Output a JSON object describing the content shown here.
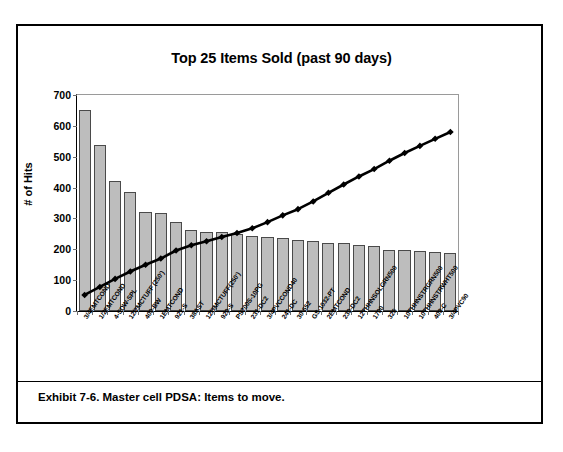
{
  "exhibit": {
    "caption": "Exhibit 7-6. Master cell PDSA: Items to move."
  },
  "chart_data": {
    "type": "bar",
    "title": "Top 25 Items Sold (past 90 days)",
    "xlabel": "",
    "ylabel": "# of Hits",
    "ylim": [
      0,
      700
    ],
    "yticks": [
      0,
      100,
      200,
      300,
      400,
      500,
      600,
      700
    ],
    "grid": false,
    "legend": false,
    "bar_color": "#bdbdbd",
    "line_color": "#000000",
    "categories": [
      "3/4EMTCOND",
      "1/2EMTCOND",
      "4-SDW-SPL",
      "12/2MCTUFF (250')",
      "400-BW",
      "1EMTCOND",
      "921-S",
      "38AST",
      "12/3MCTUFF(250')",
      "920-S",
      "PS200S-10PG",
      "231-DC2",
      "3/4PVCCOND40",
      "241-DC",
      "30-652",
      "GS-1032-PT",
      "2EMTCOND",
      "230-DC2",
      "12THHNSOLGRN500",
      "1700",
      "326",
      "10THHNSTRGRN500",
      "10THHNSTRWHT500",
      "403-C",
      "3/4PVC90"
    ],
    "series": [
      {
        "name": "# of Hits",
        "type": "bar",
        "values": [
          650,
          537,
          420,
          387,
          322,
          318,
          288,
          262,
          257,
          255,
          248,
          243,
          240,
          238,
          231,
          228,
          221,
          219,
          215,
          212,
          199,
          197,
          193,
          191,
          188
        ]
      },
      {
        "name": "Cumulative",
        "type": "line",
        "marker": "diamond",
        "values": [
          52,
          78,
          104,
          128,
          150,
          170,
          196,
          213,
          226,
          240,
          253,
          268,
          288,
          310,
          330,
          355,
          383,
          410,
          436,
          460,
          487,
          512,
          535,
          558,
          580
        ]
      }
    ]
  }
}
